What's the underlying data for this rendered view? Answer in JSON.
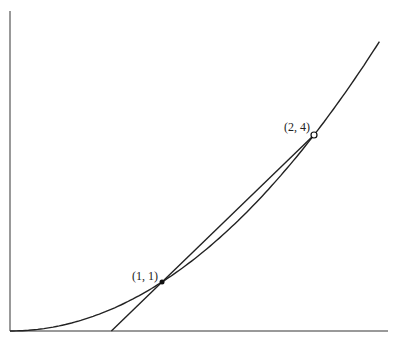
{
  "diagram": {
    "type": "function-graph-with-secant",
    "function": "y = x^2",
    "axes": {
      "origin_px": [
        10,
        331
      ],
      "x_end_px": 388,
      "y_top_px": 11,
      "px_per_unit_x": 152,
      "px_per_unit_y": 49,
      "color": "#777777"
    },
    "curve": {
      "x_start": 0,
      "x_end": 2.43,
      "color": "#222222"
    },
    "secant_line": {
      "slope": 3,
      "intercept": -2,
      "x_start": 0.667,
      "x_end": 2.0,
      "color": "#222222"
    },
    "points": [
      {
        "label": "(1, 1)",
        "x": 1,
        "y": 1,
        "style": "filled"
      },
      {
        "label": "(2, 4)",
        "x": 2,
        "y": 4,
        "style": "open"
      }
    ]
  }
}
